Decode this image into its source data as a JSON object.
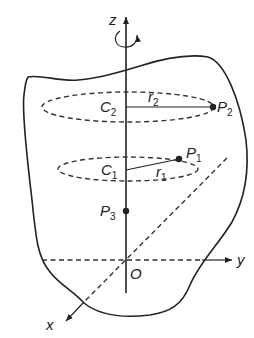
{
  "figure": {
    "type": "rigid-body-rotation-about-fixed-axis",
    "colors": {
      "ink": "#222222",
      "background": "#ffffff"
    },
    "axes": {
      "z": {
        "label": "z"
      },
      "y": {
        "label": "y"
      },
      "x": {
        "label": "x"
      },
      "origin": {
        "label": "O"
      }
    },
    "rotation_indicator": "curved-arrow-about-z",
    "circles": [
      {
        "center_label": "C",
        "center_sub": "2",
        "radius_label": "r",
        "radius_sub": "2",
        "point_label": "P",
        "point_sub": "2"
      },
      {
        "center_label": "C",
        "center_sub": "1",
        "radius_label": "r",
        "radius_sub": "1",
        "point_label": "P",
        "point_sub": "1"
      }
    ],
    "axis_point": {
      "label": "P",
      "sub": "3"
    }
  }
}
